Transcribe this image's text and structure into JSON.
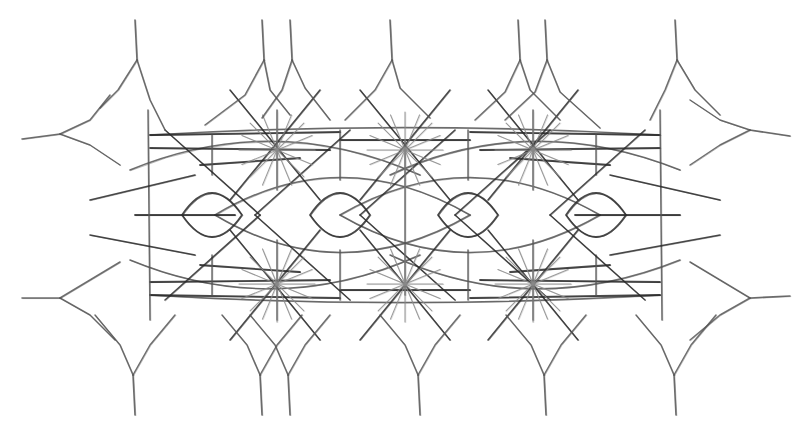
{
  "figure": {
    "width": 801,
    "height": 430,
    "background": "#ffffff",
    "ink_dark": "#2a2a2a",
    "ink_mid": "#555555",
    "ink_light": "#8a8a8a",
    "center_y": 215,
    "hub_row_y": [
      150,
      284
    ],
    "hub_x": [
      277,
      405,
      533
    ],
    "lens_centers_x": [
      212,
      340,
      468,
      596
    ],
    "top_cusps": [
      {
        "stem_x": 135,
        "tip_y": 20,
        "fork_y": 60,
        "arms": [
          [
            118,
            90,
            100,
            108
          ],
          [
            150,
            100,
            165,
            130
          ]
        ]
      },
      {
        "stem_x": 262,
        "tip_y": 20,
        "fork_y": 60,
        "arms": [
          [
            245,
            95,
            205,
            125
          ],
          [
            270,
            90,
            290,
            115
          ]
        ]
      },
      {
        "stem_x": 290,
        "tip_y": 20,
        "fork_y": 60,
        "arms": [
          [
            282,
            90,
            262,
            118
          ],
          [
            305,
            88,
            330,
            120
          ]
        ]
      },
      {
        "stem_x": 390,
        "tip_y": 20,
        "fork_y": 60,
        "arms": [
          [
            375,
            90,
            345,
            120
          ],
          [
            400,
            88,
            430,
            118
          ]
        ]
      },
      {
        "stem_x": 518,
        "tip_y": 20,
        "fork_y": 60,
        "arms": [
          [
            505,
            92,
            475,
            120
          ],
          [
            530,
            90,
            560,
            120
          ]
        ]
      },
      {
        "stem_x": 545,
        "tip_y": 20,
        "fork_y": 60,
        "arms": [
          [
            535,
            92,
            505,
            120
          ],
          [
            560,
            92,
            600,
            128
          ]
        ]
      },
      {
        "stem_x": 675,
        "tip_y": 20,
        "fork_y": 60,
        "arms": [
          [
            665,
            90,
            650,
            120
          ],
          [
            695,
            90,
            720,
            115
          ]
        ]
      }
    ],
    "side_cusps": [
      {
        "side": "left",
        "tip_x": 22,
        "y": 139,
        "fork_x": 60,
        "fork_y": 134,
        "arms": [
          [
            90,
            120,
            110,
            95
          ],
          [
            90,
            145,
            120,
            165
          ]
        ]
      },
      {
        "side": "left",
        "tip_x": 22,
        "y": 298,
        "fork_x": 60,
        "fork_y": 298,
        "arms": [
          [
            90,
            280,
            120,
            262
          ],
          [
            90,
            315,
            115,
            340
          ]
        ]
      },
      {
        "side": "right",
        "tip_x": 790,
        "y": 136,
        "fork_x": 750,
        "fork_y": 130,
        "arms": [
          [
            720,
            120,
            690,
            100
          ],
          [
            720,
            145,
            690,
            165
          ]
        ]
      },
      {
        "side": "right",
        "tip_x": 790,
        "y": 296,
        "fork_x": 750,
        "fork_y": 298,
        "arms": [
          [
            720,
            280,
            690,
            262
          ],
          [
            720,
            315,
            690,
            340
          ]
        ]
      }
    ],
    "arcs": [
      {
        "x1": 130,
        "y1": 170,
        "cx": 275,
        "cy": 110,
        "x2": 420,
        "y2": 175
      },
      {
        "x1": 390,
        "y1": 175,
        "cx": 530,
        "cy": 110,
        "x2": 680,
        "y2": 170
      },
      {
        "x1": 130,
        "y1": 260,
        "cx": 275,
        "cy": 320,
        "x2": 420,
        "y2": 255
      },
      {
        "x1": 390,
        "y1": 255,
        "cx": 530,
        "cy": 320,
        "x2": 680,
        "y2": 260
      },
      {
        "x1": 215,
        "y1": 215,
        "cx": 340,
        "cy": 140,
        "x2": 470,
        "y2": 215
      },
      {
        "x1": 340,
        "y1": 215,
        "cx": 470,
        "cy": 140,
        "x2": 600,
        "y2": 215
      },
      {
        "x1": 215,
        "y1": 215,
        "cx": 340,
        "cy": 290,
        "x2": 470,
        "y2": 215
      },
      {
        "x1": 340,
        "y1": 215,
        "cx": 470,
        "cy": 290,
        "x2": 600,
        "y2": 215
      },
      {
        "x1": 150,
        "y1": 135,
        "cx": 400,
        "cy": 120,
        "x2": 660,
        "y2": 135
      },
      {
        "x1": 150,
        "y1": 295,
        "cx": 400,
        "cy": 310,
        "x2": 660,
        "y2": 295
      }
    ],
    "horizontal_bars": [
      [
        150,
        135,
        340,
        132
      ],
      [
        340,
        140,
        470,
        140
      ],
      [
        470,
        132,
        660,
        135
      ],
      [
        150,
        148,
        330,
        150
      ],
      [
        480,
        150,
        660,
        148
      ],
      [
        150,
        282,
        330,
        280
      ],
      [
        480,
        280,
        660,
        282
      ],
      [
        150,
        295,
        340,
        298
      ],
      [
        340,
        290,
        470,
        290
      ],
      [
        470,
        298,
        660,
        295
      ],
      [
        135,
        215,
        235,
        215
      ],
      [
        575,
        215,
        680,
        215
      ],
      [
        200,
        165,
        300,
        158
      ],
      [
        510,
        158,
        610,
        165
      ],
      [
        200,
        265,
        300,
        272
      ],
      [
        510,
        272,
        610,
        265
      ]
    ],
    "vertical_bars": [
      [
        148,
        110,
        150,
        320
      ],
      [
        212,
        135,
        212,
        175
      ],
      [
        212,
        255,
        212,
        295
      ],
      [
        340,
        130,
        340,
        180
      ],
      [
        340,
        250,
        340,
        300
      ],
      [
        468,
        130,
        468,
        180
      ],
      [
        468,
        250,
        468,
        300
      ],
      [
        596,
        135,
        596,
        175
      ],
      [
        596,
        255,
        596,
        295
      ],
      [
        660,
        110,
        662,
        320
      ],
      [
        405,
        140,
        405,
        295
      ],
      [
        277,
        110,
        277,
        190
      ],
      [
        277,
        240,
        277,
        320
      ],
      [
        533,
        110,
        533,
        190
      ],
      [
        533,
        240,
        533,
        320
      ]
    ],
    "diagonals": [
      [
        165,
        130,
        260,
        215
      ],
      [
        165,
        300,
        260,
        215
      ],
      [
        360,
        215,
        455,
        130
      ],
      [
        360,
        215,
        455,
        300
      ],
      [
        645,
        130,
        550,
        215
      ],
      [
        645,
        300,
        550,
        215
      ],
      [
        255,
        215,
        350,
        130
      ],
      [
        255,
        215,
        350,
        300
      ],
      [
        455,
        215,
        550,
        130
      ],
      [
        455,
        215,
        550,
        300
      ],
      [
        230,
        90,
        320,
        200
      ],
      [
        320,
        90,
        230,
        200
      ],
      [
        360,
        90,
        450,
        200
      ],
      [
        450,
        90,
        360,
        200
      ],
      [
        488,
        90,
        578,
        200
      ],
      [
        578,
        90,
        488,
        200
      ],
      [
        230,
        340,
        320,
        230
      ],
      [
        320,
        340,
        230,
        230
      ],
      [
        360,
        340,
        450,
        230
      ],
      [
        450,
        340,
        360,
        230
      ],
      [
        488,
        340,
        578,
        230
      ],
      [
        578,
        340,
        488,
        230
      ],
      [
        90,
        200,
        195,
        175
      ],
      [
        90,
        235,
        195,
        255
      ],
      [
        610,
        175,
        720,
        200
      ],
      [
        610,
        255,
        720,
        235
      ]
    ],
    "star_spokes": 8,
    "star_radius": 38,
    "lens": {
      "rx": 30,
      "ry": 22
    },
    "bottom_cusps": [
      {
        "stem_x": 135,
        "tip_y": 415,
        "fork_y": 375
      },
      {
        "stem_x": 262,
        "tip_y": 415,
        "fork_y": 375
      },
      {
        "stem_x": 290,
        "tip_y": 415,
        "fork_y": 375
      },
      {
        "stem_x": 420,
        "tip_y": 415,
        "fork_y": 375
      },
      {
        "stem_x": 546,
        "tip_y": 415,
        "fork_y": 375
      },
      {
        "stem_x": 676,
        "tip_y": 415,
        "fork_y": 375
      }
    ]
  }
}
